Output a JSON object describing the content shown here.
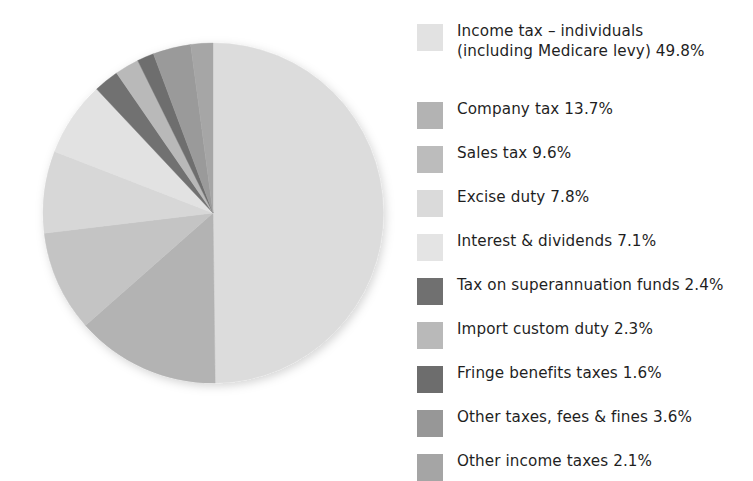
{
  "chart_data": {
    "type": "pie",
    "title": "",
    "subtitle": "",
    "xlabel": "",
    "ylabel": "",
    "legend_position": "right",
    "grid": false,
    "start_angle_deg": 0,
    "direction": "clockwise",
    "unit": "%",
    "categories": [
      "Income tax – individuals\n(including Medicare levy)",
      "Company tax",
      "Sales tax",
      "Excise duty",
      "Interest & dividends",
      "Tax on superannuation funds",
      "Import custom duty",
      "Fringe benefits taxes",
      "Other taxes, fees & fines",
      "Other income taxes"
    ],
    "values": [
      49.8,
      13.7,
      9.6,
      7.8,
      7.1,
      2.4,
      2.3,
      1.6,
      3.6,
      2.1
    ],
    "colors": [
      "#dcdcdc",
      "#b3b3b3",
      "#c4c4c4",
      "#d7d7d7",
      "#e2e2e2",
      "#717171",
      "#b9b9b9",
      "#6e6e6e",
      "#9a9a9a",
      "#a6a6a6"
    ],
    "slice_order": [
      "Income tax – individuals (including Medicare levy)",
      "Company tax",
      "Sales tax",
      "Excise duty",
      "Interest & dividends",
      "Tax on superannuation funds",
      "Import custom duty",
      "Fringe benefits taxes",
      "Other taxes, fees & fines",
      "Other income taxes"
    ]
  },
  "legend": {
    "items": [
      {
        "label": "Income tax – individuals\n(including Medicare levy) 49.8%",
        "swatch": "#e2e2e2"
      },
      {
        "label": "Company tax 13.7%",
        "swatch": "#b3b3b3"
      },
      {
        "label": "Sales tax 9.6%",
        "swatch": "#bcbcbc"
      },
      {
        "label": "Excise duty 7.8%",
        "swatch": "#dadada"
      },
      {
        "label": "Interest & dividends 7.1%",
        "swatch": "#e4e4e4"
      },
      {
        "label": "Tax on superannuation funds 2.4%",
        "swatch": "#707070"
      },
      {
        "label": "Import custom duty 2.3%",
        "swatch": "#b9b9b9"
      },
      {
        "label": "Fringe benefits taxes 1.6%",
        "swatch": "#6d6d6d"
      },
      {
        "label": "Other taxes, fees & fines 3.6%",
        "swatch": "#979797"
      },
      {
        "label": "Other income taxes 2.1%",
        "swatch": "#a5a5a5"
      }
    ]
  },
  "pie": {
    "center_x": 213,
    "center_y": 213,
    "radius": 170
  }
}
